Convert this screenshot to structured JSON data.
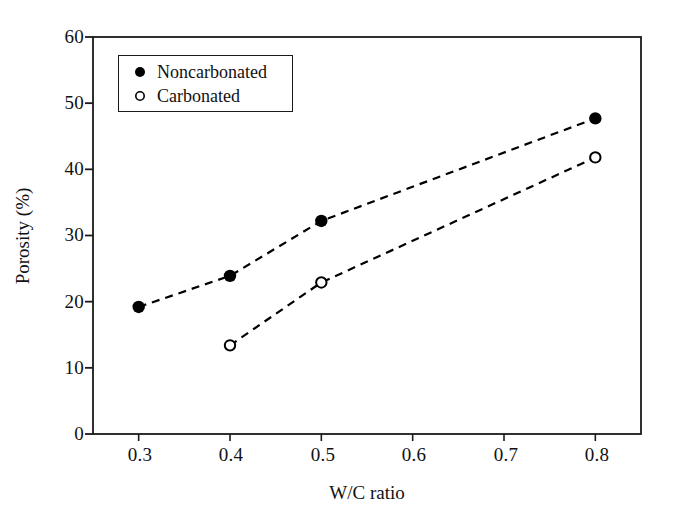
{
  "chart_data": {
    "type": "scatter",
    "title": "",
    "xlabel": "W/C ratio",
    "ylabel": "Porosity (%)",
    "xlim": [
      0.25,
      0.85
    ],
    "ylim": [
      0,
      60
    ],
    "xticks": [
      "0.3",
      "0.4",
      "0.5",
      "0.6",
      "0.7",
      "0.8"
    ],
    "xtick_values": [
      0.3,
      0.4,
      0.5,
      0.6,
      0.7,
      0.8
    ],
    "yticks": [
      "0",
      "10",
      "20",
      "30",
      "40",
      "50",
      "60"
    ],
    "ytick_values": [
      0,
      10,
      20,
      30,
      40,
      50,
      60
    ],
    "grid": false,
    "legend_position": "upper-left-inside",
    "line_style": "dashed",
    "series": [
      {
        "name": "Noncarbonated",
        "marker": "filled-circle",
        "color": "#000000",
        "x": [
          0.3,
          0.4,
          0.5,
          0.8
        ],
        "values": [
          19.2,
          23.9,
          32.2,
          47.7
        ]
      },
      {
        "name": "Carbonated",
        "marker": "open-circle",
        "color": "#000000",
        "x": [
          0.4,
          0.5,
          0.8
        ],
        "values": [
          13.4,
          22.9,
          41.8
        ]
      }
    ]
  },
  "legend": {
    "entries": [
      {
        "label": "Noncarbonated",
        "marker": "filled-circle"
      },
      {
        "label": "Carbonated",
        "marker": "open-circle"
      }
    ]
  },
  "axes": {
    "x_title": "W/C ratio",
    "y_title": "Porosity (%)"
  },
  "colors": {
    "ink": "#1a1a1a",
    "background": "#ffffff",
    "marker": "#000000"
  }
}
